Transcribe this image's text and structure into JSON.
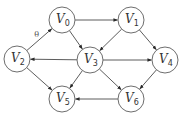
{
  "diagram": {
    "type": "directed-graph",
    "colors": {
      "stroke": "#6e6e6e",
      "edge": "#4a4a4a",
      "text": "#333333",
      "background": "#ffffff"
    },
    "nodes": [
      {
        "id": "v0",
        "base": "V",
        "sub": "0",
        "x": 62,
        "y": 20
      },
      {
        "id": "v1",
        "base": "V",
        "sub": "1",
        "x": 131,
        "y": 20
      },
      {
        "id": "v2",
        "base": "V",
        "sub": "2",
        "x": 17,
        "y": 59
      },
      {
        "id": "v3",
        "base": "V",
        "sub": "3",
        "x": 90,
        "y": 60
      },
      {
        "id": "v4",
        "base": "V",
        "sub": "4",
        "x": 165,
        "y": 60
      },
      {
        "id": "v5",
        "base": "V",
        "sub": "5",
        "x": 62,
        "y": 99
      },
      {
        "id": "v6",
        "base": "V",
        "sub": "6",
        "x": 131,
        "y": 99
      }
    ],
    "edges": [
      {
        "from": "v2",
        "to": "v0",
        "label": "θ"
      },
      {
        "from": "v0",
        "to": "v1",
        "label": ""
      },
      {
        "from": "v0",
        "to": "v3",
        "label": ""
      },
      {
        "from": "v1",
        "to": "v3",
        "label": ""
      },
      {
        "from": "v1",
        "to": "v4",
        "label": ""
      },
      {
        "from": "v3",
        "to": "v2",
        "label": ""
      },
      {
        "from": "v3",
        "to": "v4",
        "label": ""
      },
      {
        "from": "v3",
        "to": "v5",
        "label": ""
      },
      {
        "from": "v3",
        "to": "v6",
        "label": ""
      },
      {
        "from": "v2",
        "to": "v5",
        "label": ""
      },
      {
        "from": "v4",
        "to": "v6",
        "label": ""
      },
      {
        "from": "v6",
        "to": "v5",
        "label": ""
      }
    ],
    "node_radius": 13
  }
}
